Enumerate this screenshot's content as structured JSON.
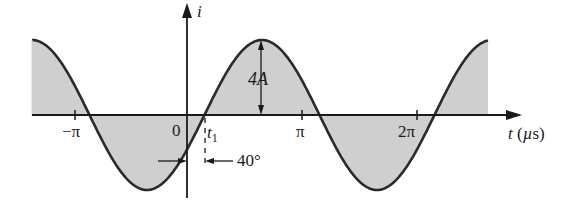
{
  "diagram": {
    "type": "sinusoidal waveform",
    "function": "i = 4 sin(wt - 40°)",
    "colors": {
      "curve": "#2a2a2a",
      "fill": "#cfcfcf",
      "axis": "#1a1a1a"
    },
    "axes": {
      "x_label": "t (µs)",
      "y_label": "i",
      "x_ticks": [
        {
          "label": "−π",
          "pos": -3.14159
        },
        {
          "label": "0",
          "pos": 0
        },
        {
          "label": "π",
          "pos": 3.14159
        },
        {
          "label": "2π",
          "pos": 6.28318
        }
      ]
    },
    "annotations": {
      "amplitude": "4A",
      "t1": "t",
      "t1_sub": "1",
      "phase": "40°"
    }
  }
}
